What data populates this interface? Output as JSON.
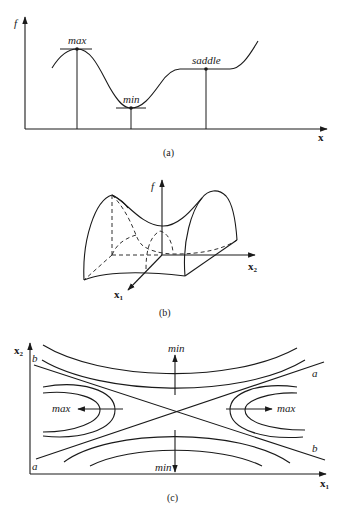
{
  "panel_a": {
    "caption": "(a)",
    "y_axis_label": "f",
    "x_axis_label": "x",
    "points": [
      {
        "label": "max",
        "type": "maximum"
      },
      {
        "label": "min",
        "type": "minimum"
      },
      {
        "label": "saddle",
        "type": "saddle / inflection"
      }
    ]
  },
  "panel_b": {
    "caption": "(b)",
    "vertical_axis_label": "f",
    "axis_x1_label": "x",
    "axis_x1_sub": "1",
    "axis_x2_label": "x",
    "axis_x2_sub": "2",
    "description": "3D saddle surface"
  },
  "panel_c": {
    "caption": "(c)",
    "y_axis_label": "x",
    "y_axis_sub": "2",
    "x_axis_label": "x",
    "x_axis_sub": "1",
    "asymptote_labels": {
      "a_top": "a",
      "a_bottom": "a",
      "b_top": "b",
      "b_bottom": "b"
    },
    "direction_labels": {
      "min_top": "min",
      "min_bottom": "min",
      "max_left": "max",
      "max_right": "max"
    }
  },
  "colors": {
    "stroke": "#1a1a1a",
    "background": "#ffffff"
  }
}
